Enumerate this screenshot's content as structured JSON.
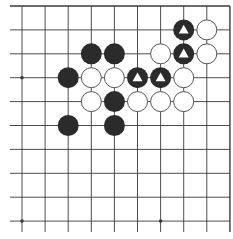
{
  "board": {
    "description": "Go board fragment, top-right corner view",
    "columns": 10,
    "rows": 10,
    "edges": [
      "top",
      "right"
    ],
    "star_points": [
      [
        0,
        3
      ],
      [
        0,
        9
      ],
      [
        6,
        9
      ]
    ],
    "colors": {
      "line": "#3a3a3a",
      "black_stone": "#2b2b2b",
      "white_stone": "#ffffff",
      "stone_outline": "#555555",
      "marker": "#ffffff"
    },
    "stones": [
      {
        "col": 7,
        "row": 1,
        "color": "black",
        "marker": "triangle"
      },
      {
        "col": 8,
        "row": 1,
        "color": "white"
      },
      {
        "col": 3,
        "row": 2,
        "color": "black"
      },
      {
        "col": 4,
        "row": 2,
        "color": "black"
      },
      {
        "col": 6,
        "row": 2,
        "color": "white"
      },
      {
        "col": 7,
        "row": 2,
        "color": "black",
        "marker": "triangle"
      },
      {
        "col": 8,
        "row": 2,
        "color": "white"
      },
      {
        "col": 2,
        "row": 3,
        "color": "black"
      },
      {
        "col": 3,
        "row": 3,
        "color": "white"
      },
      {
        "col": 4,
        "row": 3,
        "color": "white"
      },
      {
        "col": 5,
        "row": 3,
        "color": "black",
        "marker": "triangle"
      },
      {
        "col": 6,
        "row": 3,
        "color": "black",
        "marker": "triangle"
      },
      {
        "col": 7,
        "row": 3,
        "color": "white"
      },
      {
        "col": 3,
        "row": 4,
        "color": "white"
      },
      {
        "col": 4,
        "row": 4,
        "color": "black"
      },
      {
        "col": 5,
        "row": 4,
        "color": "white"
      },
      {
        "col": 6,
        "row": 4,
        "color": "white"
      },
      {
        "col": 7,
        "row": 4,
        "color": "white"
      },
      {
        "col": 2,
        "row": 5,
        "color": "black"
      },
      {
        "col": 4,
        "row": 5,
        "color": "black"
      }
    ]
  }
}
